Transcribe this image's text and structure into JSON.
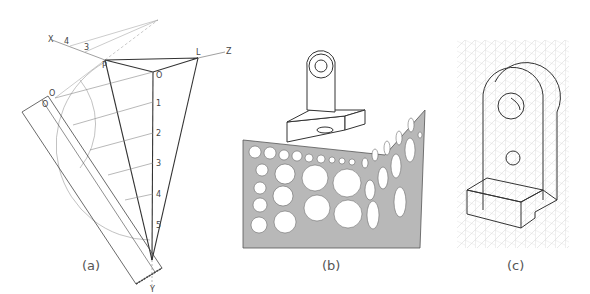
{
  "figure": {
    "panels": [
      {
        "id": "a",
        "caption": "(a)",
        "description": "Isometric scale construction: rotated ruler with projections onto vertical axis",
        "axis_labels": {
          "x": "X",
          "z": "Z",
          "y": "Y",
          "l": "L",
          "p": "P"
        },
        "axis_scale_marks": [
          "4",
          "3"
        ],
        "vertical_scale": [
          "O",
          "1",
          "2",
          "3",
          "4",
          "5"
        ],
        "ruler_marks": [
          "O",
          "1",
          "2",
          "3",
          "4",
          "5"
        ]
      },
      {
        "id": "b",
        "caption": "(b)",
        "description": "Isometric ellipse template with bracket part drawn on top"
      },
      {
        "id": "c",
        "caption": "(c)",
        "description": "Bracket drawn on isometric grid paper"
      }
    ],
    "colors": {
      "line": "#333333",
      "light_line": "#888888",
      "template_gray": "#b8b8b8",
      "grid_gray": "#cfcfcf"
    }
  }
}
